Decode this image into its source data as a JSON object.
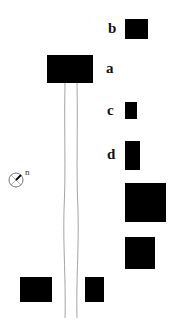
{
  "diagram": {
    "type": "site-plan",
    "background": "#ffffff",
    "block_color": "#000000",
    "labels": {
      "a": "a",
      "b": "b",
      "c": "c",
      "d": "d"
    },
    "compass": {
      "north_label": "n"
    },
    "blocks": [
      {
        "id": "a",
        "x": 47,
        "y": 55,
        "w": 46,
        "h": 28
      },
      {
        "id": "b",
        "x": 125,
        "y": 19,
        "w": 23,
        "h": 20
      },
      {
        "id": "c",
        "x": 125,
        "y": 102,
        "w": 12,
        "h": 17
      },
      {
        "id": "d",
        "x": 125,
        "y": 141,
        "w": 15,
        "h": 29
      },
      {
        "id": "e",
        "x": 125,
        "y": 183,
        "w": 41,
        "h": 39
      },
      {
        "id": "f",
        "x": 125,
        "y": 237,
        "w": 30,
        "h": 32
      },
      {
        "id": "g",
        "x": 20,
        "y": 277,
        "w": 32,
        "h": 25
      },
      {
        "id": "h",
        "x": 85,
        "y": 277,
        "w": 19,
        "h": 25
      }
    ]
  }
}
